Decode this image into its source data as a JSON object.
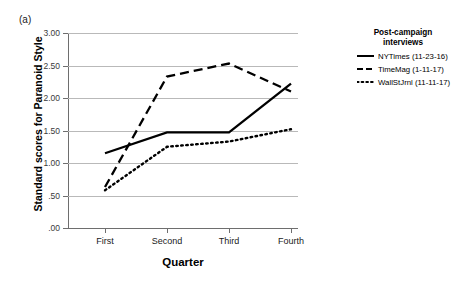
{
  "panel": {
    "label": "(a)"
  },
  "legend": {
    "title_line1": "Post-campaign",
    "title_line2": "interviews",
    "entries": [
      {
        "label": "NYTimes (11-23-16)",
        "style": "solid",
        "key_name": "legend-key-solid"
      },
      {
        "label": "TimeMag (1-11-17)",
        "style": "dashed",
        "key_name": "legend-key-dashed"
      },
      {
        "label": "WallStJrnl (11-11-17)",
        "style": "dotted",
        "key_name": "legend-key-dotted"
      }
    ]
  },
  "chart_data": {
    "type": "line",
    "title": "",
    "xlabel": "Quarter",
    "ylabel": "Standard scores for Paranoid Style",
    "categories": [
      "First",
      "Second",
      "Third",
      "Fourth"
    ],
    "ylim": [
      0.0,
      3.0
    ],
    "ytick_values": [
      3.0,
      2.5,
      2.0,
      1.5,
      1.0,
      0.5,
      0.0
    ],
    "ytick_labels": [
      "3.00",
      "2.50",
      "2.00",
      "1.50",
      "1.00",
      ".50",
      ".00"
    ],
    "grid": true,
    "legend_position": "right",
    "series": [
      {
        "name": "NYTimes (11-23-16)",
        "style": "solid",
        "color": "#000000",
        "values": [
          1.15,
          1.47,
          1.47,
          2.22
        ]
      },
      {
        "name": "TimeMag (1-11-17)",
        "style": "dashed",
        "color": "#000000",
        "values": [
          0.63,
          2.33,
          2.53,
          2.1
        ]
      },
      {
        "name": "WallStJrnl (11-11-17)",
        "style": "dotted",
        "color": "#000000",
        "values": [
          0.58,
          1.25,
          1.33,
          1.52
        ]
      }
    ]
  }
}
